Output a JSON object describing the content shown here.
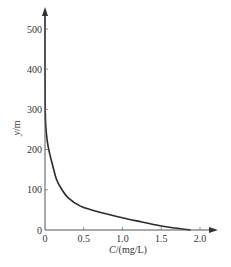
{
  "chart_data": {
    "type": "line",
    "title": "",
    "xlabel": "C/(mg/L)",
    "ylabel": "y/m",
    "xlim": [
      0,
      2.0
    ],
    "ylim": [
      0,
      500
    ],
    "grid": false,
    "legend": null,
    "x_ticks": [
      "0",
      "0.5",
      "1.0",
      "1.5",
      "2.0"
    ],
    "y_ticks": [
      "0",
      "100",
      "200",
      "300",
      "400",
      "500"
    ],
    "series": [
      {
        "name": "C vs y",
        "color": "#2a2a2a",
        "points": [
          {
            "x": 0.0,
            "y": 540
          },
          {
            "x": 0.0,
            "y": 400
          },
          {
            "x": 0.003,
            "y": 300
          },
          {
            "x": 0.01,
            "y": 260
          },
          {
            "x": 0.03,
            "y": 220
          },
          {
            "x": 0.06,
            "y": 190
          },
          {
            "x": 0.1,
            "y": 160
          },
          {
            "x": 0.15,
            "y": 125
          },
          {
            "x": 0.22,
            "y": 100
          },
          {
            "x": 0.3,
            "y": 80
          },
          {
            "x": 0.45,
            "y": 60
          },
          {
            "x": 0.6,
            "y": 50
          },
          {
            "x": 0.9,
            "y": 35
          },
          {
            "x": 1.2,
            "y": 22
          },
          {
            "x": 1.5,
            "y": 10
          },
          {
            "x": 1.75,
            "y": 3
          },
          {
            "x": 1.88,
            "y": 0
          }
        ]
      }
    ]
  },
  "axes": {
    "x_label_italic": "C",
    "x_label_rest": "/(mg/L)",
    "y_label_italic": "y",
    "y_label_rest": "/m"
  }
}
